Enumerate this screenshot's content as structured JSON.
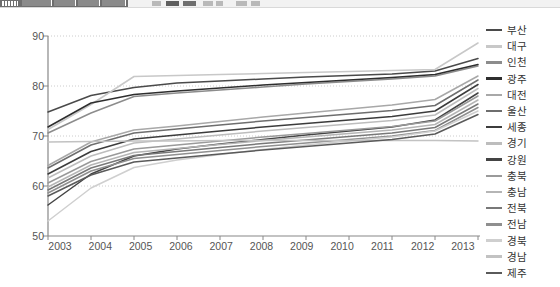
{
  "toolbar": {
    "visible": true,
    "note": "partially cropped application toolbar strip"
  },
  "chart_data": {
    "type": "line",
    "title": "",
    "subtitle": "",
    "xlabel": "",
    "ylabel": "",
    "x": [
      "2003",
      "2004",
      "2005",
      "2006",
      "2007",
      "2008",
      "2009",
      "2010",
      "2011",
      "2012",
      "2013"
    ],
    "categories": [
      "2003",
      "2004",
      "2005",
      "2006",
      "2007",
      "2008",
      "2009",
      "2010",
      "2011",
      "2012",
      "2013"
    ],
    "ylim": [
      50,
      90
    ],
    "y_ticks": [
      50,
      60,
      70,
      80,
      90
    ],
    "x_ticks": [
      "2003",
      "2004",
      "2005",
      "2006",
      "2007",
      "2008",
      "2009",
      "2010",
      "2011",
      "2012",
      "2013"
    ],
    "grid": true,
    "grid_axis": "y",
    "legend_position": "right",
    "series": [
      {
        "name": "부산",
        "color": "#4a4a4a",
        "values": [
          74.8,
          78.1,
          79.7,
          80.6,
          81.0,
          81.4,
          81.8,
          82.1,
          82.4,
          83.0,
          85.5
        ]
      },
      {
        "name": "대구",
        "color": "#c8c8c8",
        "values": [
          71.3,
          76.3,
          81.9,
          82.1,
          82.3,
          82.5,
          82.7,
          82.9,
          83.1,
          83.3,
          88.6
        ]
      },
      {
        "name": "인천",
        "color": "#8c8c8c",
        "values": [
          70.6,
          74.6,
          77.9,
          78.6,
          79.2,
          79.8,
          80.4,
          80.9,
          81.4,
          82.0,
          84.0
        ]
      },
      {
        "name": "광주",
        "color": "#2e2e2e",
        "values": [
          71.8,
          76.6,
          78.3,
          79.0,
          79.6,
          80.2,
          80.7,
          81.2,
          81.7,
          82.3,
          84.3
        ]
      },
      {
        "name": "대전",
        "color": "#a8a8a8",
        "values": [
          64.1,
          68.8,
          71.2,
          72.0,
          72.9,
          73.8,
          74.6,
          75.4,
          76.2,
          77.3,
          82.0
        ]
      },
      {
        "name": "울산",
        "color": "#6e6e6e",
        "values": [
          63.6,
          68.2,
          70.6,
          71.4,
          72.2,
          73.0,
          73.7,
          74.4,
          75.1,
          76.1,
          81.2
        ]
      },
      {
        "name": "세종",
        "color": "#3c3c3c",
        "values": [
          62.4,
          66.9,
          69.4,
          70.2,
          71.0,
          71.8,
          72.5,
          73.2,
          73.9,
          75.0,
          80.3
        ]
      },
      {
        "name": "경기",
        "color": "#bdbdbd",
        "values": [
          61.6,
          66.0,
          68.6,
          69.4,
          70.2,
          71.0,
          71.7,
          72.4,
          73.1,
          74.2,
          79.5
        ]
      },
      {
        "name": "강원",
        "color": "#444444",
        "values": [
          56.2,
          62.4,
          66.0,
          67.4,
          68.4,
          69.3,
          70.2,
          71.0,
          71.8,
          73.2,
          78.6
        ]
      },
      {
        "name": "충북",
        "color": "#9a9a9a",
        "values": [
          60.6,
          64.9,
          67.4,
          68.2,
          69.0,
          69.8,
          70.5,
          71.2,
          71.9,
          73.0,
          78.0
        ]
      },
      {
        "name": "충남",
        "color": "#b5b5b5",
        "values": [
          59.8,
          64.2,
          66.7,
          67.5,
          68.3,
          69.1,
          69.8,
          70.5,
          71.2,
          72.3,
          77.2
        ]
      },
      {
        "name": "전북",
        "color": "#787878",
        "values": [
          59.2,
          63.6,
          66.1,
          66.9,
          67.7,
          68.5,
          69.2,
          69.9,
          70.6,
          71.7,
          76.4
        ]
      },
      {
        "name": "전남",
        "color": "#8f8f8f",
        "values": [
          58.6,
          63.0,
          65.5,
          66.3,
          67.1,
          67.9,
          68.6,
          69.3,
          70.0,
          71.1,
          75.7
        ]
      },
      {
        "name": "경북",
        "color": "#cfcfcf",
        "values": [
          53.0,
          59.6,
          63.7,
          65.2,
          66.3,
          67.3,
          68.2,
          69.0,
          69.8,
          71.0,
          75.0
        ]
      },
      {
        "name": "경남",
        "color": "#c2c2c2",
        "values": [
          68.8,
          68.9,
          69.0,
          69.0,
          69.1,
          69.1,
          69.1,
          69.1,
          69.1,
          69.1,
          69.0
        ]
      },
      {
        "name": "제주",
        "color": "#5a5a5a",
        "values": [
          58.0,
          62.2,
          64.8,
          65.6,
          66.4,
          67.2,
          67.9,
          68.6,
          69.3,
          70.4,
          74.3
        ]
      }
    ]
  },
  "axes": {
    "y_tick_labels": [
      "90",
      "80",
      "70",
      "60",
      "50"
    ],
    "x_tick_labels": [
      "2003",
      "2004",
      "2005",
      "2006",
      "2007",
      "2008",
      "2009",
      "2010",
      "2011",
      "2012",
      "2013"
    ]
  },
  "legend": {
    "items": [
      {
        "label": "부산",
        "color": "#4a4a4a"
      },
      {
        "label": "대구",
        "color": "#c8c8c8"
      },
      {
        "label": "인천",
        "color": "#8c8c8c"
      },
      {
        "label": "광주",
        "color": "#2e2e2e"
      },
      {
        "label": "대전",
        "color": "#a8a8a8"
      },
      {
        "label": "울산",
        "color": "#6e6e6e"
      },
      {
        "label": "세종",
        "color": "#3c3c3c"
      },
      {
        "label": "경기",
        "color": "#bdbdbd"
      },
      {
        "label": "강원",
        "color": "#444444"
      },
      {
        "label": "충북",
        "color": "#9a9a9a"
      },
      {
        "label": "충남",
        "color": "#b5b5b5"
      },
      {
        "label": "전북",
        "color": "#787878"
      },
      {
        "label": "전남",
        "color": "#8f8f8f"
      },
      {
        "label": "경북",
        "color": "#cfcfcf"
      },
      {
        "label": "경남",
        "color": "#c2c2c2"
      },
      {
        "label": "제주",
        "color": "#5a5a5a"
      }
    ]
  },
  "colors": {
    "axis": "#888888",
    "grid": "#cccccc",
    "tick_text": "#555555",
    "legend_text": "#333333",
    "background": "#ffffff"
  }
}
